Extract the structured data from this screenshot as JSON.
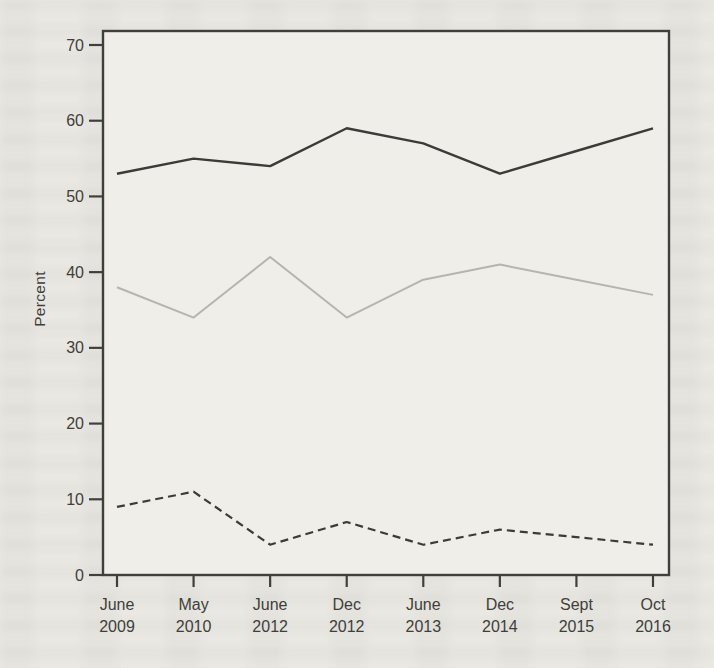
{
  "page": {
    "background_color": "#e9e8e3",
    "plot_background": "#efeee9"
  },
  "chart_data": {
    "type": "line",
    "title": "",
    "xlabel": "",
    "ylabel": "Percent",
    "ylim": [
      0,
      70
    ],
    "yticks": [
      0,
      10,
      20,
      30,
      40,
      50,
      60,
      70
    ],
    "grid": false,
    "legend": "none",
    "axis_color": "#413f3c",
    "label_color": "#3f3e3b",
    "categories": [
      [
        "June",
        "2009"
      ],
      [
        "May",
        "2010"
      ],
      [
        "June",
        "2012"
      ],
      [
        "Dec",
        "2012"
      ],
      [
        "June",
        "2013"
      ],
      [
        "Dec",
        "2014"
      ],
      [
        "Sept",
        "2015"
      ],
      [
        "Oct",
        "2016"
      ]
    ],
    "series": [
      {
        "name": "solid-black-line",
        "style": "solid",
        "color": "#3c3b38",
        "width": 2.4,
        "values": [
          53,
          55,
          54,
          59,
          57,
          53,
          56,
          59
        ]
      },
      {
        "name": "solid-gray-line",
        "style": "solid",
        "color": "#b6b4b0",
        "width": 2.0,
        "values": [
          38,
          34,
          42,
          34,
          39,
          41,
          39,
          37
        ]
      },
      {
        "name": "dashed-black-line",
        "style": "dashed",
        "color": "#3c3b38",
        "width": 2.2,
        "values": [
          9,
          11,
          4,
          7,
          4,
          6,
          5,
          4
        ]
      }
    ]
  }
}
